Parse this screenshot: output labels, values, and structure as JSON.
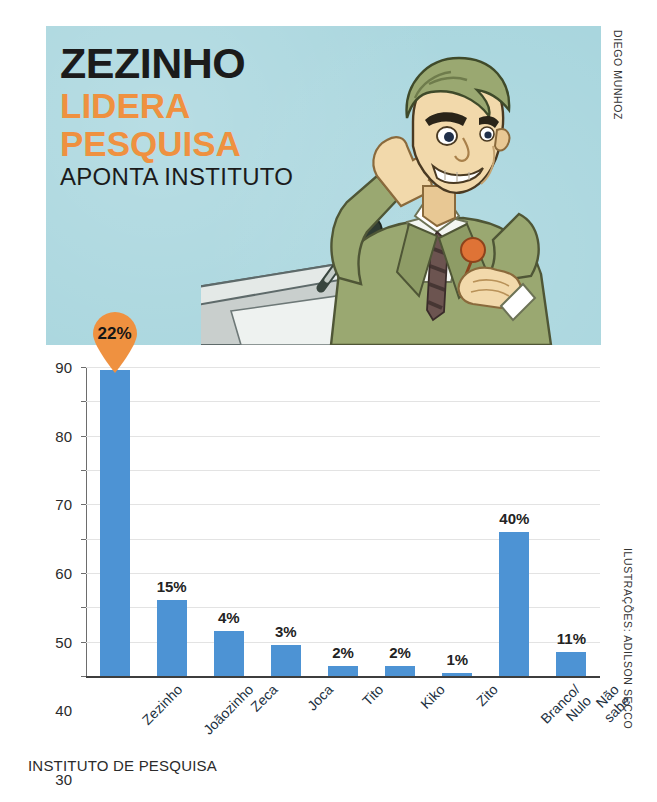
{
  "headline": {
    "line1": "ZEZINHO",
    "line2": "LIDERA",
    "line3": "PESQUISA",
    "line4": "APONTA INSTITUTO"
  },
  "credits": {
    "illustration_top": "DIEGO MUNHOZ",
    "illustration_chart": "ILUSTRAÇÕES: ADILSON SECCO"
  },
  "source": "INSTITUTO DE PESQUISA",
  "colors": {
    "panel_background": "#a9d6de",
    "headline_dark": "#1b1b1b",
    "headline_orange": "#ef9140",
    "bar_blue": "#4d93d4",
    "pin_orange": "#ef9140",
    "gridline": "#e3e3e3",
    "axis": "#3d3d3d",
    "suit_green": "#9aa871",
    "skin": "#f2d9ab"
  },
  "chart_data": {
    "type": "bar",
    "title": "",
    "xlabel": "",
    "ylabel": "",
    "ylim": [
      0,
      90
    ],
    "yticks": [
      0,
      10,
      20,
      30,
      40,
      50,
      60,
      70,
      80,
      90
    ],
    "grid": true,
    "legend": "none",
    "categories": [
      "Zezinho",
      "Joãozinho",
      "Zeca",
      "Joca",
      "Tito",
      "Kiko",
      "Zito",
      "Branco/\nNulo",
      "Não\nsabe"
    ],
    "values": [
      89,
      22,
      13,
      9,
      3,
      3,
      1,
      42,
      7
    ],
    "data_labels": [
      "22%",
      "15%",
      "4%",
      "3%",
      "2%",
      "2%",
      "1%",
      "40%",
      "11%"
    ],
    "highlighted_index": 0,
    "highlight_style": "pin-marker"
  }
}
